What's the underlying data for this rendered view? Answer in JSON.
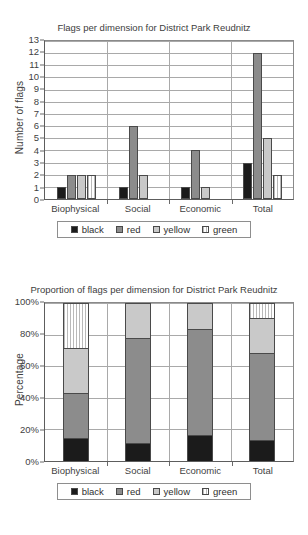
{
  "charts": [
    {
      "title": "Flags per dimension for District Park Reudnitz",
      "ylabel": "Number of flags",
      "xlabel": "",
      "categories": [
        "Biophysical",
        "Social",
        "Economic",
        "Total"
      ],
      "yticks": [
        "0",
        "1",
        "2",
        "3",
        "4",
        "5",
        "6",
        "7",
        "8",
        "9",
        "10",
        "11",
        "12",
        "13"
      ],
      "legend": [
        {
          "label": "black",
          "key": "black"
        },
        {
          "label": "red",
          "key": "red"
        },
        {
          "label": "yellow",
          "key": "yellow"
        },
        {
          "label": "green",
          "key": "green"
        }
      ]
    },
    {
      "title": "Proportion of flags per dimension for District Park Reudnitz",
      "ylabel": "Percentage",
      "xlabel": "",
      "categories": [
        "Biophysical",
        "Social",
        "Economic",
        "Total"
      ],
      "yticks": [
        "0%",
        "20%",
        "40%",
        "60%",
        "80%",
        "100%"
      ],
      "legend": [
        {
          "label": "black",
          "key": "black"
        },
        {
          "label": "red",
          "key": "red"
        },
        {
          "label": "yellow",
          "key": "yellow"
        },
        {
          "label": "green",
          "key": "green"
        }
      ]
    }
  ],
  "chart_data": [
    {
      "type": "bar",
      "title": "Flags per dimension for District Park Reudnitz",
      "xlabel": "",
      "ylabel": "Number of flags",
      "ylim": [
        0,
        13
      ],
      "grid": true,
      "legend_position": "bottom",
      "categories": [
        "Biophysical",
        "Social",
        "Economic",
        "Total"
      ],
      "series": [
        {
          "name": "black",
          "color": "#1b1b1b",
          "values": [
            1,
            1,
            1,
            3
          ]
        },
        {
          "name": "red",
          "color": "#8c8c8c",
          "values": [
            2,
            6,
            4,
            12
          ]
        },
        {
          "name": "yellow",
          "color": "#c9c9c9",
          "values": [
            2,
            2,
            1,
            5
          ]
        },
        {
          "name": "green",
          "color": "#ffffff",
          "values": [
            2,
            0,
            0,
            2
          ]
        }
      ]
    },
    {
      "type": "bar",
      "title": "Proportion of flags per dimension for District Park Reudnitz",
      "xlabel": "",
      "ylabel": "Percentage",
      "ylim": [
        0,
        100
      ],
      "grid": true,
      "stacked": true,
      "legend_position": "bottom",
      "categories": [
        "Biophysical",
        "Social",
        "Economic",
        "Total"
      ],
      "series": [
        {
          "name": "black",
          "color": "#1b1b1b",
          "values": [
            14.3,
            11.1,
            16.7,
            13.6
          ]
        },
        {
          "name": "red",
          "color": "#8c8c8c",
          "values": [
            28.6,
            66.7,
            66.7,
            54.5
          ]
        },
        {
          "name": "yellow",
          "color": "#c9c9c9",
          "values": [
            28.6,
            22.2,
            16.7,
            22.7
          ]
        },
        {
          "name": "green",
          "color": "#ffffff",
          "values": [
            28.6,
            0,
            0,
            9.1
          ]
        }
      ]
    }
  ]
}
